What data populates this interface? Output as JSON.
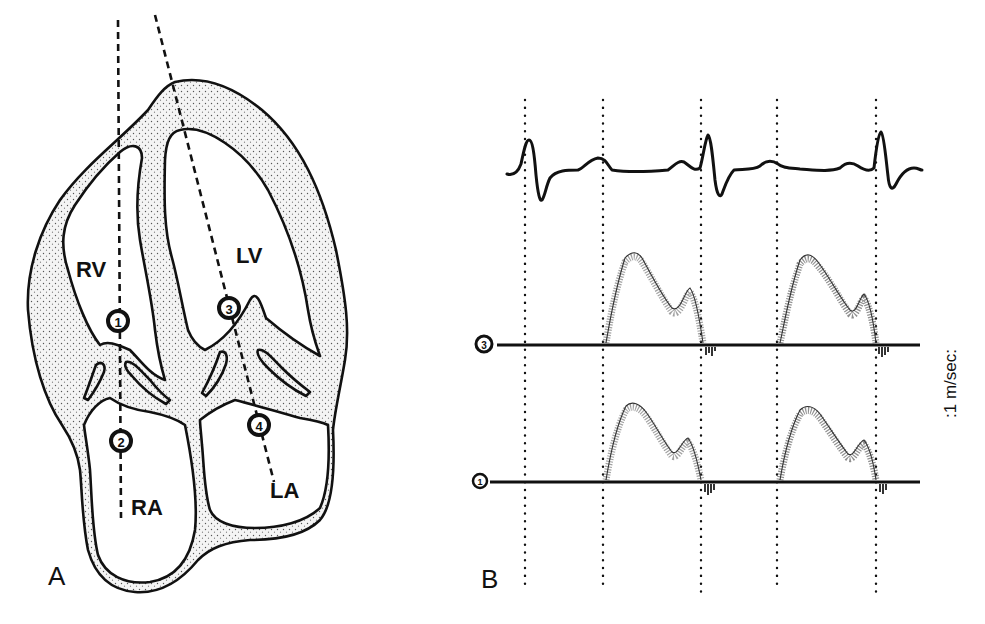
{
  "panel_a": {
    "label": "A",
    "chambers": {
      "rv": "RV",
      "lv": "LV",
      "ra": "RA",
      "la": "LA"
    },
    "sample_sites": [
      {
        "num": "1",
        "glyph": "①",
        "x": 118,
        "y": 321
      },
      {
        "num": "2",
        "glyph": "②",
        "x": 121,
        "y": 441
      },
      {
        "num": "3",
        "glyph": "③",
        "x": 229,
        "y": 308
      },
      {
        "num": "4",
        "glyph": "④",
        "x": 259,
        "y": 425
      }
    ]
  },
  "panel_b": {
    "label": "B",
    "scale_label": ":1 m/sec:",
    "trace_labels": {
      "upper": "③",
      "lower": "①"
    },
    "marker_lines_x": [
      525,
      603,
      701,
      777,
      876
    ]
  },
  "colors": {
    "ink": "#111111",
    "background": "#ffffff",
    "wall_stipple": "#e6e6e6"
  }
}
